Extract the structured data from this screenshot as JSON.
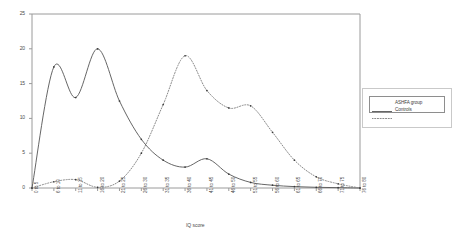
{
  "chart_data": {
    "type": "line",
    "title": "",
    "xlabel": "IQ score",
    "ylabel": "",
    "ylim": [
      0,
      25
    ],
    "ytick_values": [
      0,
      5,
      10,
      15,
      20,
      25
    ],
    "ytick_labels": [
      "0",
      "5",
      "10",
      "15",
      "20",
      "25"
    ],
    "grid": false,
    "legend_position": "right-outside",
    "categories": [
      "0 to 5",
      "6 to 10",
      "11 to 15",
      "16 to 20",
      "21 to 25",
      "26 to 30",
      "31 to 35",
      "36 to 40",
      "41 to 45",
      "46 to 50",
      "51 to 55",
      "56 to 60",
      "61 to 65",
      "66 to 70",
      "71 to 75",
      "76 to 80"
    ],
    "series": [
      {
        "name": "ASHFA group",
        "style": "solid",
        "color": "#555555",
        "values": [
          0,
          17.4,
          13.0,
          20.0,
          12.5,
          7.0,
          4.0,
          3.0,
          4.2,
          2.0,
          0.8,
          0.4,
          0.2,
          0.1,
          0.05,
          0
        ]
      },
      {
        "name": "Controls",
        "style": "dotted",
        "color": "#8a8a8a",
        "values": [
          0,
          0.9,
          1.2,
          0.1,
          1.0,
          5.0,
          12.0,
          19.0,
          14.0,
          11.5,
          11.8,
          8.0,
          4.0,
          1.6,
          0.6,
          0
        ]
      }
    ]
  },
  "legend": {
    "entries": [
      {
        "label": "ASHFA group",
        "style": "solid"
      },
      {
        "label": "Controls",
        "style": "dotted"
      }
    ]
  },
  "axis": {
    "x_title": "IQ score"
  }
}
